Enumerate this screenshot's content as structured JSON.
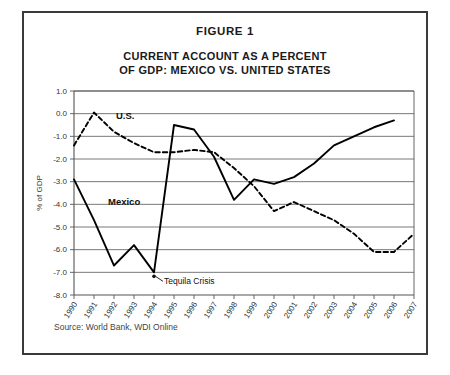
{
  "figure": {
    "label": "FIGURE 1",
    "title_line1": "CURRENT ACCOUNT AS A PERCENT",
    "title_line2": "OF GDP: MEXICO VS. UNITED STATES",
    "source": "Source: World Bank, WDI Online"
  },
  "chart_data": {
    "type": "line",
    "title": "CURRENT ACCOUNT AS A PERCENT OF GDP: MEXICO VS. UNITED STATES",
    "xlabel": "",
    "ylabel": "% of GDP",
    "ylim": [
      -8.0,
      1.0
    ],
    "ytick_step": 1.0,
    "ytick_labels": [
      "1.0",
      "0.0",
      "-1.0",
      "-2.0",
      "-3.0",
      "-4.0",
      "-5.0",
      "-6.0",
      "-7.0",
      "-8.0"
    ],
    "ytick_values": [
      1.0,
      0.0,
      -1.0,
      -2.0,
      -3.0,
      -4.0,
      -5.0,
      -6.0,
      -7.0,
      -8.0
    ],
    "grid": true,
    "legend_position": "inline-labels",
    "categories": [
      "1990",
      "1991",
      "1992",
      "1993",
      "1994",
      "1995",
      "1996",
      "1997",
      "1998",
      "1999",
      "2000",
      "2001",
      "2002",
      "2003",
      "2004",
      "2005",
      "2006",
      "2007"
    ],
    "x": [
      1990,
      1991,
      1992,
      1993,
      1994,
      1995,
      1996,
      1997,
      1998,
      1999,
      2000,
      2001,
      2002,
      2003,
      2004,
      2005,
      2006,
      2007
    ],
    "series": [
      {
        "name": "Mexico",
        "style": "solid",
        "color": "#000000",
        "values": [
          -2.9,
          -4.7,
          -6.7,
          -5.8,
          -7.0,
          -0.5,
          -0.7,
          -1.9,
          -3.8,
          -2.9,
          -3.1,
          -2.8,
          -2.2,
          -1.4,
          -1.0,
          -0.6,
          -0.3,
          null
        ]
      },
      {
        "name": "U.S.",
        "style": "dashed",
        "color": "#000000",
        "values": [
          -1.4,
          0.05,
          -0.8,
          -1.3,
          -1.7,
          -1.7,
          -1.6,
          -1.7,
          -2.4,
          -3.2,
          -4.3,
          -3.9,
          -4.3,
          -4.7,
          -5.3,
          -6.1,
          -6.1,
          -5.3
        ]
      }
    ],
    "annotations": [
      {
        "text": "Tequila Crisis",
        "points_to_x": 1994,
        "points_to_y": -7.0
      },
      {
        "text": "Mexico",
        "type": "series-label",
        "at_x": 1992,
        "at_y": -4.0
      },
      {
        "text": "U.S.",
        "type": "series-label",
        "at_x": 1992,
        "at_y": -0.3
      }
    ]
  }
}
